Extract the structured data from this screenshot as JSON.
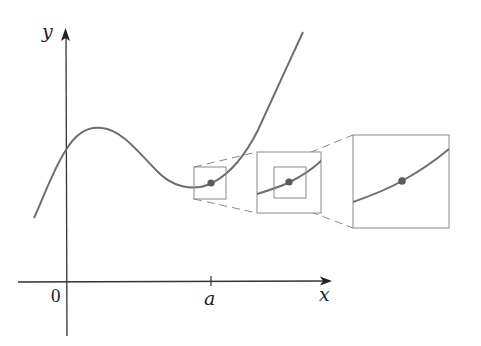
{
  "figure": {
    "axes": {
      "x_label": "x",
      "y_label": "y",
      "origin_label": "0",
      "tick_label": "a"
    },
    "colors": {
      "curve": "#6e6e6e",
      "axes": "#333333",
      "boxes": "#8a8a8a",
      "dashed": "#8a8a8a",
      "point": "#5a5a5a"
    },
    "zoom_boxes": [
      {
        "name": "small",
        "level": 1
      },
      {
        "name": "medium",
        "level": 2
      },
      {
        "name": "large",
        "level": 3
      }
    ]
  }
}
